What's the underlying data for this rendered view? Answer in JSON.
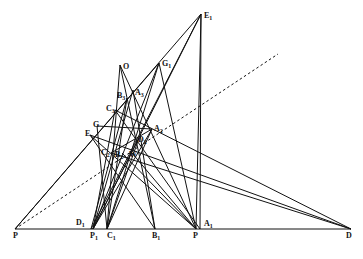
{
  "diagram": {
    "type": "geometric-construction",
    "points": [
      {
        "id": "E1",
        "label": "E1",
        "x": 201,
        "y": 14,
        "lx": 204,
        "ly": 18
      },
      {
        "id": "G1",
        "label": "G1",
        "x": 159,
        "y": 63,
        "lx": 162,
        "ly": 66
      },
      {
        "id": "O",
        "label": "O",
        "x": 120,
        "y": 65,
        "lx": 123,
        "ly": 69
      },
      {
        "id": "B3",
        "label": "B3",
        "x": 127,
        "y": 98,
        "lx": 117,
        "ly": 98
      },
      {
        "id": "A3",
        "label": "A3",
        "x": 133,
        "y": 90,
        "lx": 135,
        "ly": 95
      },
      {
        "id": "C3",
        "label": "C3",
        "x": 115,
        "y": 110,
        "lx": 106,
        "ly": 111
      },
      {
        "id": "G",
        "label": "G",
        "x": 97,
        "y": 126,
        "lx": 93,
        "ly": 127
      },
      {
        "id": "E",
        "label": "E",
        "x": 90,
        "y": 135,
        "lx": 85,
        "ly": 136
      },
      {
        "id": "A2",
        "label": "A2",
        "x": 152,
        "y": 129,
        "lx": 154,
        "ly": 131
      },
      {
        "id": "D2",
        "label": "D2",
        "x": 139,
        "y": 138,
        "lx": 138,
        "ly": 142
      },
      {
        "id": "C2",
        "label": "C2",
        "x": 111,
        "y": 153,
        "lx": 101,
        "ly": 155
      },
      {
        "id": "B2",
        "label": "B2",
        "x": 122,
        "y": 153,
        "lx": 115,
        "ly": 157
      },
      {
        "id": "W",
        "label": "W",
        "x": 132,
        "y": 153,
        "lx": 129,
        "ly": 157
      },
      {
        "id": "P",
        "label": "P",
        "x": 15,
        "y": 229,
        "lx": 13,
        "ly": 238
      },
      {
        "id": "D1",
        "label": "D1",
        "x": 91,
        "y": 229,
        "lx": 76,
        "ly": 225
      },
      {
        "id": "P1",
        "label": "P1",
        "x": 93,
        "y": 229,
        "lx": 90,
        "ly": 238
      },
      {
        "id": "C1",
        "label": "C1",
        "x": 107,
        "y": 229,
        "lx": 107,
        "ly": 238
      },
      {
        "id": "B1",
        "label": "B1",
        "x": 155,
        "y": 229,
        "lx": 152,
        "ly": 238
      },
      {
        "id": "P2",
        "label": "P",
        "x": 196,
        "y": 229,
        "lx": 193,
        "ly": 238
      },
      {
        "id": "A1",
        "label": "A1",
        "x": 200,
        "y": 229,
        "lx": 204,
        "ly": 226
      },
      {
        "id": "D",
        "label": "D",
        "x": 351,
        "y": 229,
        "lx": 346,
        "ly": 238
      }
    ],
    "segments": [
      [
        "P",
        "D"
      ],
      [
        "P",
        "E1"
      ],
      [
        "P",
        "G1"
      ],
      [
        "E1",
        "D1"
      ],
      [
        "E1",
        "P1"
      ],
      [
        "E1",
        "A1"
      ],
      [
        "E1",
        "P2"
      ],
      [
        "G1",
        "P1"
      ],
      [
        "G1",
        "C1"
      ],
      [
        "G1",
        "P2"
      ],
      [
        "O",
        "B1"
      ],
      [
        "O",
        "C1"
      ],
      [
        "O",
        "P2"
      ],
      [
        "C3",
        "D"
      ],
      [
        "C3",
        "A1"
      ],
      [
        "C3",
        "P1"
      ],
      [
        "E",
        "B1"
      ],
      [
        "E",
        "P2"
      ],
      [
        "G",
        "A2"
      ],
      [
        "G",
        "C1"
      ],
      [
        "E",
        "D"
      ],
      [
        "A2",
        "P1"
      ],
      [
        "A2",
        "C1"
      ],
      [
        "A3",
        "P1"
      ],
      [
        "A3",
        "B1"
      ],
      [
        "B3",
        "C1"
      ],
      [
        "B3",
        "D1"
      ],
      [
        "C2",
        "D"
      ],
      [
        "C2",
        "A2"
      ],
      [
        "B2",
        "P2"
      ],
      [
        "W",
        "P2"
      ],
      [
        "D2",
        "P1"
      ],
      [
        "D2",
        "C1"
      ]
    ],
    "dashed": [
      {
        "from": [
          15,
          229
        ],
        "to": [
          278,
          54
        ]
      }
    ],
    "labels_subscript": true
  }
}
